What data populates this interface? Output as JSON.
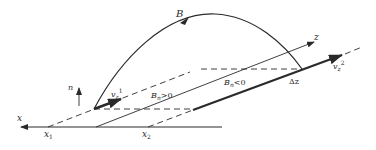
{
  "diagram": {
    "colors": {
      "background": "#ffffff",
      "stroke": "#2a2a2a"
    },
    "labels": {
      "field_line": "B",
      "normal": "n",
      "x_axis": "x",
      "z_axis": "z",
      "x1": "x",
      "x1_sub": "1",
      "x2": "x",
      "x2_sub": "2",
      "vz1": "v",
      "vz1_sub": "z",
      "vz1_sup": "1",
      "vz2": "v",
      "vz2_sub": "z",
      "vz2_sup": "2",
      "bn_positive": "B",
      "bn_positive_sub": "n",
      "bn_positive_rel": ">0",
      "bn_negative": "B",
      "bn_negative_sub": "n",
      "bn_negative_rel": "<0",
      "delta_z": "Δz"
    }
  }
}
